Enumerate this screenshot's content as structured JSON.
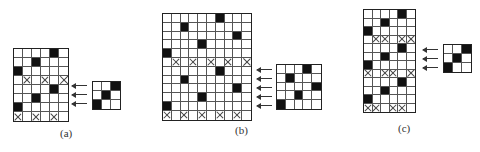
{
  "panels": [
    {
      "label": "(a)",
      "large_grid": {
        "cols": 6,
        "rows": 8,
        "black": [
          [
            0,
            4
          ],
          [
            1,
            2
          ],
          [
            2,
            0
          ],
          [
            4,
            4
          ],
          [
            5,
            2
          ],
          [
            6,
            0
          ]
        ],
        "crossed": [
          [
            3,
            1
          ],
          [
            3,
            3
          ],
          [
            3,
            5
          ],
          [
            7,
            0
          ],
          [
            7,
            2
          ],
          [
            7,
            4
          ]
        ]
      },
      "small_grid": {
        "cols": 3,
        "rows": 3,
        "black": [
          [
            0,
            2
          ],
          [
            1,
            1
          ],
          [
            2,
            0
          ]
        ]
      },
      "arrow_count": 3
    },
    {
      "label": "(b)",
      "large_grid": {
        "cols": 10,
        "rows": 12,
        "black": [
          [
            0,
            6
          ],
          [
            1,
            2
          ],
          [
            2,
            8
          ],
          [
            3,
            4
          ],
          [
            4,
            0
          ],
          [
            6,
            6
          ],
          [
            7,
            2
          ],
          [
            8,
            8
          ],
          [
            9,
            4
          ],
          [
            10,
            0
          ]
        ],
        "crossed": [
          [
            5,
            1
          ],
          [
            5,
            3
          ],
          [
            5,
            5
          ],
          [
            5,
            7
          ],
          [
            5,
            9
          ],
          [
            11,
            0
          ],
          [
            11,
            2
          ],
          [
            11,
            4
          ],
          [
            11,
            6
          ],
          [
            11,
            8
          ]
        ]
      },
      "small_grid": {
        "cols": 5,
        "rows": 5,
        "black": [
          [
            0,
            3
          ],
          [
            1,
            1
          ],
          [
            2,
            4
          ],
          [
            3,
            2
          ],
          [
            4,
            0
          ]
        ]
      },
      "arrow_count": 5
    },
    {
      "label": "(c)",
      "large_grid": {
        "cols": 6,
        "rows": 12,
        "black": [
          [
            0,
            4
          ],
          [
            1,
            2
          ],
          [
            2,
            0
          ],
          [
            4,
            4
          ],
          [
            5,
            2
          ],
          [
            6,
            0
          ],
          [
            8,
            4
          ],
          [
            9,
            2
          ],
          [
            10,
            0
          ]
        ],
        "crossed": [
          [
            3,
            1
          ],
          [
            3,
            2
          ],
          [
            3,
            4
          ],
          [
            3,
            5
          ],
          [
            7,
            0
          ],
          [
            7,
            2
          ],
          [
            7,
            3
          ],
          [
            7,
            5
          ],
          [
            11,
            0
          ],
          [
            11,
            1
          ],
          [
            11,
            3
          ],
          [
            11,
            4
          ]
        ]
      },
      "small_grid": {
        "cols": 3,
        "rows": 3,
        "black": [
          [
            0,
            2
          ],
          [
            1,
            1
          ],
          [
            2,
            0
          ]
        ]
      },
      "arrow_count": 3
    }
  ],
  "colors": {
    "fill": "#111111",
    "grid_line": "#555555",
    "background": "#ffffff"
  }
}
